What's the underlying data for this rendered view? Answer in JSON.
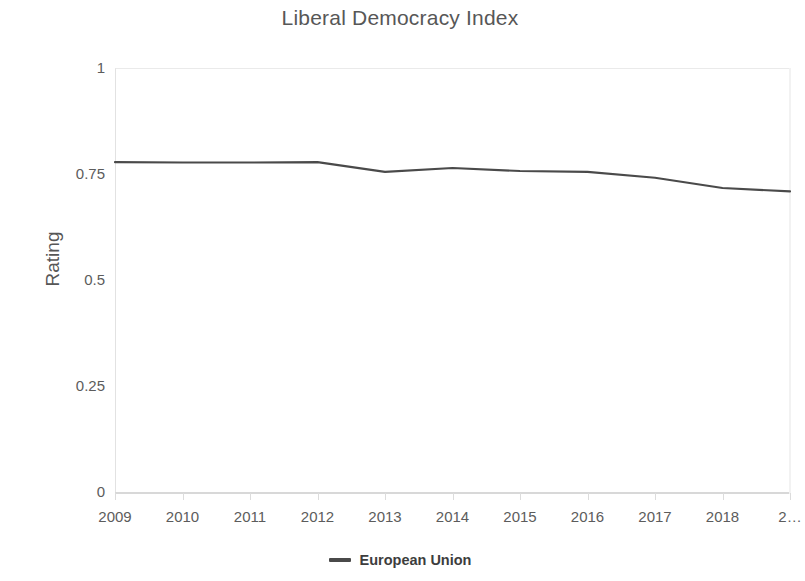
{
  "chart_data": {
    "type": "line",
    "title": "Liberal Democracy Index",
    "xlabel": "",
    "ylabel": "Rating",
    "grid": true,
    "legend_position": "bottom",
    "x": [
      2009,
      2010,
      2011,
      2012,
      2013,
      2014,
      2015,
      2016,
      2017,
      2018,
      2019
    ],
    "xtick_labels": [
      "2009",
      "2010",
      "2011",
      "2012",
      "2013",
      "2014",
      "2015",
      "2016",
      "2017",
      "2018",
      "2…"
    ],
    "ytick_labels": [
      "0",
      "0.25",
      "0.5",
      "0.75",
      "1"
    ],
    "ytick_values": [
      0,
      0.25,
      0.5,
      0.75,
      1
    ],
    "ylim": [
      0,
      1
    ],
    "xlim": [
      2009,
      2019
    ],
    "series": [
      {
        "name": "European Union",
        "color": "#4a4a4a",
        "values": [
          0.778,
          0.777,
          0.777,
          0.778,
          0.755,
          0.764,
          0.757,
          0.755,
          0.741,
          0.717,
          0.709
        ]
      }
    ]
  },
  "legend": {
    "items": [
      {
        "label": "European Union",
        "color": "#4a4a4a",
        "marker": "line-marker"
      }
    ]
  },
  "colors": {
    "series_line": "#4a4a4a",
    "axis": "#d8d8d8",
    "grid": "#f6f6f6",
    "text": "#5c5c5c",
    "title": "#575757",
    "background": "#ffffff"
  }
}
